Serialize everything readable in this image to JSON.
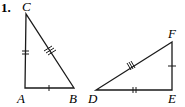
{
  "problem": {
    "number": "1."
  },
  "triangles": [
    {
      "name": "ABC",
      "vertices": [
        {
          "label": "C",
          "x": 26,
          "y": 14
        },
        {
          "label": "A",
          "x": 25,
          "y": 88
        },
        {
          "label": "B",
          "x": 74,
          "y": 88
        }
      ],
      "sides": [
        {
          "segment": "AC",
          "ticks": 2
        },
        {
          "segment": "CB",
          "ticks": 3
        },
        {
          "segment": "AB",
          "ticks": 1
        }
      ]
    },
    {
      "name": "DEF",
      "vertices": [
        {
          "label": "F",
          "x": 172,
          "y": 42
        },
        {
          "label": "D",
          "x": 96,
          "y": 90
        },
        {
          "label": "E",
          "x": 172,
          "y": 90
        }
      ],
      "sides": [
        {
          "segment": "DF",
          "ticks": 3
        },
        {
          "segment": "EF",
          "ticks": 1
        },
        {
          "segment": "DE",
          "ticks": 2
        }
      ]
    }
  ],
  "labels": {
    "C": "C",
    "A": "A",
    "B": "B",
    "F": "F",
    "D": "D",
    "E": "E"
  }
}
